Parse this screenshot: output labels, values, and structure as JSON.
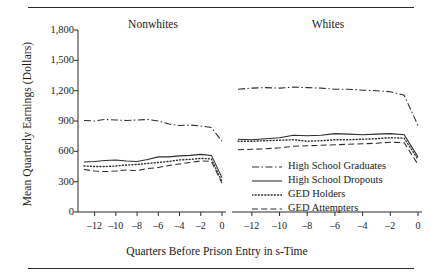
{
  "figure": {
    "y_axis_title": "Mean Quarterly Earnings (Dollars)",
    "x_axis_title": "Quarters Before Prison Entry in s-Time",
    "panels": [
      {
        "title": "Nonwhites"
      },
      {
        "title": "Whites"
      }
    ],
    "rules": {
      "top": "top-rule",
      "bottom": "bottom-rule"
    }
  },
  "legend": {
    "items": [
      {
        "label": "High School Graduates",
        "dash": "dashdot"
      },
      {
        "label": "High School Dropouts",
        "dash": "solid"
      },
      {
        "label": "GED Holders",
        "dash": "dotted"
      },
      {
        "label": "GED Attempters",
        "dash": "dashed"
      }
    ]
  },
  "chart_data": {
    "type": "line",
    "title": "",
    "xlabel": "Quarters Before Prison Entry in s-Time",
    "ylabel": "Mean Quarterly Earnings (Dollars)",
    "ylim": [
      0,
      1800
    ],
    "yticks": [
      0,
      300,
      600,
      900,
      1200,
      1500,
      1800
    ],
    "ytick_labels": [
      "0",
      "300",
      "600",
      "900",
      "1,200",
      "1,500",
      "1,800"
    ],
    "xlim": [
      -13,
      0
    ],
    "xticks": [
      -12,
      -10,
      -8,
      -6,
      -4,
      -2,
      0
    ],
    "xtick_labels": [
      "–12",
      "–10",
      "–8",
      "–6",
      "–4",
      "–2",
      "0"
    ],
    "grid": false,
    "legend_position": "inside-lower-right",
    "x": [
      -13,
      -12,
      -11,
      -10,
      -9,
      -8,
      -7,
      -6,
      -5,
      -4,
      -3,
      -2,
      -1,
      0
    ],
    "panels": [
      {
        "name": "Nonwhites",
        "series": [
          {
            "name": "High School Graduates",
            "dash": "dashdot",
            "values": [
              905,
              900,
              915,
              910,
              905,
              910,
              915,
              900,
              870,
              855,
              860,
              850,
              835,
              700
            ]
          },
          {
            "name": "High School Dropouts",
            "dash": "solid",
            "values": [
              495,
              500,
              510,
              515,
              505,
              500,
              520,
              545,
              545,
              555,
              560,
              570,
              560,
              340
            ]
          },
          {
            "name": "GED Holders",
            "dash": "dotted",
            "values": [
              455,
              450,
              450,
              455,
              465,
              470,
              480,
              490,
              500,
              515,
              520,
              530,
              525,
              300
            ]
          },
          {
            "name": "GED Attempters",
            "dash": "dashed",
            "values": [
              420,
              405,
              400,
              405,
              415,
              410,
              430,
              440,
              460,
              475,
              490,
              505,
              500,
              285
            ]
          }
        ]
      },
      {
        "name": "Whites",
        "series": [
          {
            "name": "High School Graduates",
            "dash": "dashdot",
            "values": [
              1215,
              1225,
              1230,
              1225,
              1235,
              1230,
              1225,
              1215,
              1215,
              1205,
              1200,
              1190,
              1155,
              855
            ]
          },
          {
            "name": "High School Dropouts",
            "dash": "solid",
            "values": [
              720,
              715,
              725,
              735,
              760,
              755,
              760,
              775,
              770,
              765,
              770,
              775,
              765,
              545
            ]
          },
          {
            "name": "GED Holders",
            "dash": "dotted",
            "values": [
              700,
              700,
              705,
              710,
              715,
              700,
              705,
              715,
              715,
              720,
              725,
              735,
              730,
              520
            ]
          },
          {
            "name": "GED Attempters",
            "dash": "dashed",
            "values": [
              615,
              620,
              625,
              635,
              650,
              655,
              660,
              665,
              670,
              675,
              680,
              690,
              685,
              470
            ]
          }
        ]
      }
    ]
  }
}
